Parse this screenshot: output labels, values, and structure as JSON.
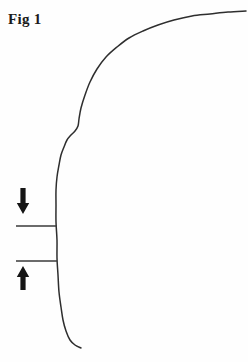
{
  "figure": {
    "caption": "Fig 1",
    "background_color": "#fefefe",
    "line_color": "#2e2e2e",
    "arrow_color": "#151515",
    "width": 248,
    "height": 362
  },
  "annotations": {
    "down_arrow": {
      "name": "down-arrow",
      "direction": "down",
      "x": 23,
      "y_top": 188,
      "y_bottom": 214
    },
    "up_arrow": {
      "name": "up-arrow",
      "direction": "up",
      "x": 23,
      "y_top": 266,
      "y_bottom": 290
    },
    "upper_tick": {
      "name": "upper-tick-line",
      "x1": 16,
      "x2": 57,
      "y": 226
    },
    "lower_tick": {
      "name": "lower-tick-line",
      "x1": 16,
      "x2": 57,
      "y": 261
    }
  },
  "chart_data": {
    "type": "line",
    "title": "Fig 1",
    "xlabel": "",
    "ylabel": "",
    "grid": false,
    "legend": null,
    "xlim": [
      0,
      248
    ],
    "ylim": [
      362,
      0
    ],
    "series": [
      {
        "name": "profile-curve",
        "points": [
          [
            246,
            11
          ],
          [
            228,
            12
          ],
          [
            210,
            14
          ],
          [
            192,
            16
          ],
          [
            174,
            20
          ],
          [
            158,
            25
          ],
          [
            143,
            31
          ],
          [
            129,
            38
          ],
          [
            117,
            47
          ],
          [
            106,
            57
          ],
          [
            97,
            69
          ],
          [
            90,
            82
          ],
          [
            85,
            95
          ],
          [
            81,
            108
          ],
          [
            79,
            119
          ],
          [
            78,
            126
          ],
          [
            75,
            131
          ],
          [
            71,
            135
          ],
          [
            67,
            140
          ],
          [
            64,
            147
          ],
          [
            61,
            155
          ],
          [
            59,
            165
          ],
          [
            57,
            177
          ],
          [
            56,
            190
          ],
          [
            56,
            205
          ],
          [
            56,
            222
          ],
          [
            57,
            240
          ],
          [
            57,
            258
          ],
          [
            58,
            275
          ],
          [
            59,
            292
          ],
          [
            61,
            307
          ],
          [
            63,
            320
          ],
          [
            66,
            331
          ],
          [
            70,
            340
          ],
          [
            75,
            345
          ],
          [
            81,
            348
          ]
        ]
      }
    ],
    "markers": [
      {
        "name": "upper-tick-line",
        "y": 226,
        "x_start": 16,
        "x_end": 57
      },
      {
        "name": "lower-tick-line",
        "y": 261,
        "x_start": 16,
        "x_end": 57
      }
    ]
  }
}
